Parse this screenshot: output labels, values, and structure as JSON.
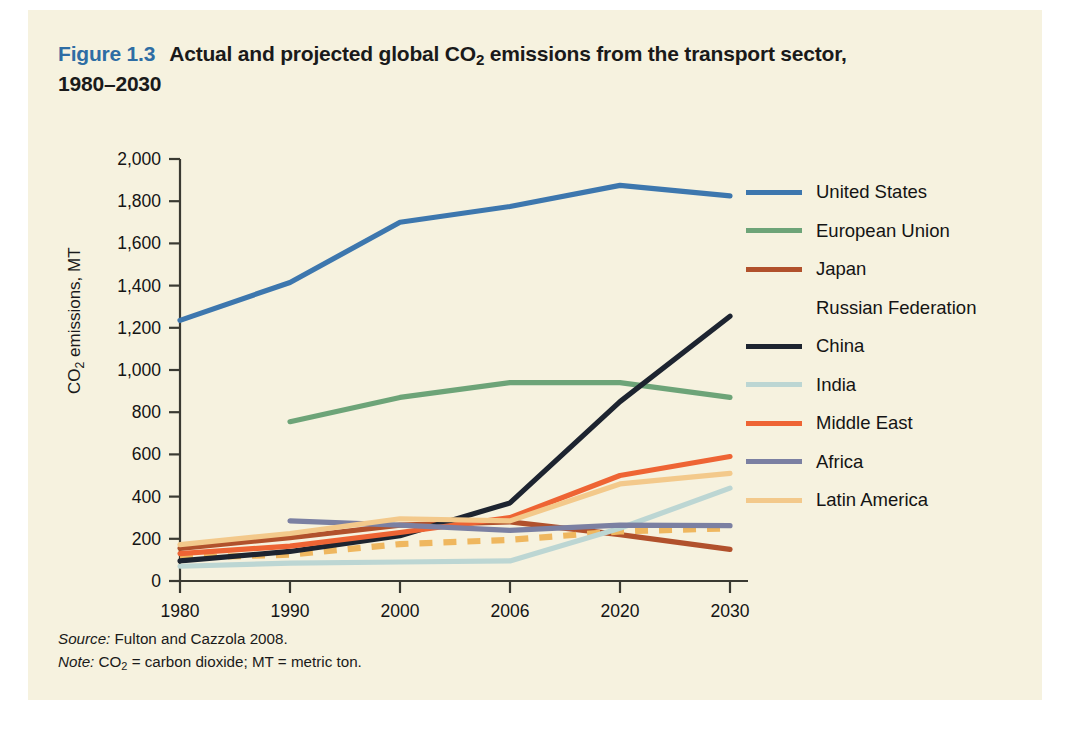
{
  "figure": {
    "number": "Figure 1.3",
    "title_line1": "Actual and projected global CO2 emissions from the transport sector,",
    "title_line2": "1980–2030",
    "title_pre_sub": "Actual and projected global CO",
    "title_sub": "2",
    "title_post_sub": " emissions from the transport sector,",
    "accent_color": "#2e6da4",
    "panel_color": "#f6f2df"
  },
  "footnotes": {
    "source_label": "Source:",
    "source_text": " Fulton and Cazzola 2008.",
    "note_label": "Note:",
    "note_pre_sub": " CO",
    "note_sub": "2",
    "note_post_sub": " = carbon dioxide; MT = metric ton."
  },
  "chart_data": {
    "type": "line",
    "title": "Actual and projected global CO2 emissions from the transport sector, 1980–2030",
    "xlabel": "",
    "ylabel": "CO2 emissions, MT",
    "categories": [
      "1980",
      "1990",
      "2000",
      "2006",
      "2020",
      "2030"
    ],
    "ylim": [
      0,
      2000
    ],
    "yticks": [
      0,
      200,
      400,
      600,
      800,
      1000,
      1200,
      1400,
      1600,
      1800,
      2000
    ],
    "ytick_labels": [
      "0",
      "200",
      "400",
      "600",
      "800",
      "1,000",
      "1,200",
      "1,400",
      "1,600",
      "1,800",
      "2,000"
    ],
    "grid": false,
    "legend_position": "right",
    "series": [
      {
        "name": "United States",
        "color": "#3d77ae",
        "style": "solid",
        "values": [
          1235,
          1415,
          1700,
          1775,
          1875,
          1825
        ]
      },
      {
        "name": "European Union",
        "color": "#6da478",
        "style": "solid",
        "values": [
          null,
          755,
          870,
          940,
          940,
          870
        ]
      },
      {
        "name": "Japan",
        "color": "#b1512c",
        "style": "solid",
        "values": [
          155,
          205,
          265,
          280,
          220,
          150
        ]
      },
      {
        "name": "Russian Federation",
        "color": "#efb75f",
        "style": "dashed",
        "values": [
          110,
          125,
          175,
          195,
          235,
          250
        ]
      },
      {
        "name": "China",
        "color": "#1d2430",
        "style": "solid",
        "values": [
          95,
          140,
          215,
          370,
          850,
          1255
        ]
      },
      {
        "name": "India",
        "color": "#bcd6d3",
        "style": "solid",
        "values": [
          70,
          85,
          90,
          95,
          250,
          440
        ]
      },
      {
        "name": "Middle East",
        "color": "#ee6434",
        "style": "solid",
        "values": [
          130,
          165,
          230,
          300,
          500,
          590
        ]
      },
      {
        "name": "Africa",
        "color": "#7b80a2",
        "style": "solid",
        "values": [
          null,
          285,
          265,
          240,
          265,
          262
        ]
      },
      {
        "name": "Latin America",
        "color": "#f3c98b",
        "style": "solid",
        "values": [
          172,
          225,
          295,
          285,
          460,
          510
        ]
      }
    ]
  }
}
